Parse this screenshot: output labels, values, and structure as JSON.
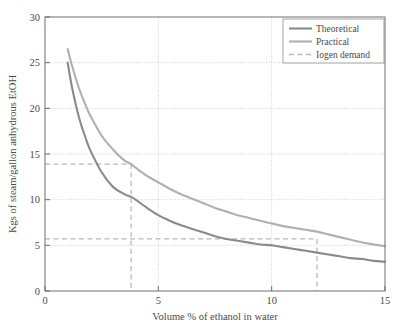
{
  "chart_data": {
    "type": "line",
    "title": "",
    "subtitle": "",
    "xlabel": "Volume % of ethanol in water",
    "ylabel": "Kgs of steam/gallon anhydrous EtOH",
    "xlim": [
      0,
      15
    ],
    "ylim": [
      0,
      30
    ],
    "xticks": [
      0,
      5,
      10,
      15
    ],
    "yticks": [
      0,
      5,
      10,
      15,
      20,
      25,
      30
    ],
    "xtick_labels": [
      "0",
      "5",
      "10",
      "15"
    ],
    "ytick_labels": [
      "0",
      "5",
      "10",
      "15",
      "20",
      "25",
      "30"
    ],
    "grid": true,
    "grid_style": "dotted",
    "legend_position": "top-right",
    "series": [
      {
        "name": "Theoretical",
        "color": "#8a8a8a",
        "style": "solid",
        "x": [
          1.0,
          1.2,
          1.5,
          1.8,
          2.0,
          2.5,
          3.0,
          3.5,
          3.8,
          4.0,
          4.5,
          5.0,
          5.5,
          6.0,
          6.5,
          7.0,
          7.5,
          8.0,
          8.5,
          9.0,
          9.5,
          10.0,
          10.5,
          11.0,
          11.5,
          12.0,
          12.5,
          13.0,
          13.5,
          14.0,
          14.5,
          15.0
        ],
        "y": [
          25.0,
          22.2,
          19.0,
          16.7,
          15.4,
          13.0,
          11.4,
          10.6,
          10.3,
          10.0,
          9.1,
          8.3,
          7.7,
          7.2,
          6.8,
          6.4,
          6.0,
          5.7,
          5.5,
          5.3,
          5.1,
          5.0,
          4.8,
          4.6,
          4.4,
          4.2,
          4.0,
          3.8,
          3.6,
          3.5,
          3.3,
          3.2
        ]
      },
      {
        "name": "Practical",
        "color": "#b0b0b0",
        "style": "solid",
        "x": [
          1.0,
          1.2,
          1.5,
          1.8,
          2.0,
          2.5,
          3.0,
          3.5,
          3.8,
          4.0,
          4.5,
          5.0,
          5.5,
          6.0,
          6.5,
          7.0,
          7.5,
          8.0,
          8.5,
          9.0,
          9.5,
          10.0,
          10.5,
          11.0,
          11.5,
          12.0,
          12.5,
          13.0,
          13.5,
          14.0,
          14.5,
          15.0
        ],
        "y": [
          26.5,
          24.6,
          22.2,
          20.3,
          19.2,
          17.0,
          15.5,
          14.3,
          13.9,
          13.5,
          12.6,
          11.9,
          11.2,
          10.6,
          10.1,
          9.6,
          9.1,
          8.7,
          8.3,
          8.0,
          7.7,
          7.4,
          7.1,
          6.9,
          6.7,
          6.5,
          6.2,
          5.9,
          5.6,
          5.3,
          5.1,
          4.9
        ]
      }
    ],
    "annotations": {
      "iogen_demand": {
        "name": "Iogen demand",
        "color": "#b8b8b8",
        "style": "dashed",
        "guides": [
          {
            "type": "horizontal",
            "y": 13.9,
            "x_from": 0,
            "x_to": 3.8
          },
          {
            "type": "vertical",
            "x": 3.8,
            "y_from": 0,
            "y_to": 13.9
          },
          {
            "type": "horizontal",
            "y": 5.7,
            "x_from": 0,
            "x_to": 12.0
          },
          {
            "type": "vertical",
            "x": 12.0,
            "y_from": 0,
            "y_to": 5.7
          }
        ]
      }
    },
    "legend": [
      {
        "label": "Theoretical",
        "color": "#8a8a8a",
        "style": "solid"
      },
      {
        "label": "Practical",
        "color": "#b0b0b0",
        "style": "solid"
      },
      {
        "label": "Iogen demand",
        "color": "#b8b8b8",
        "style": "dashed"
      }
    ]
  },
  "colors": {
    "theoretical": "#8a8a8a",
    "practical": "#b0b0b0",
    "iogen": "#b8b8b8",
    "axis": "#6e6e6e",
    "grid": "#b9b9b9",
    "text": "#4a4a4a",
    "background": "#ffffff"
  }
}
